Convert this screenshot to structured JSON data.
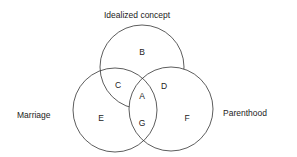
{
  "diagram": {
    "type": "venn",
    "sets": {
      "top": "Idealized concept",
      "left": "Marriage",
      "right": "Parenthood"
    },
    "regions": {
      "B": "B",
      "C": "C",
      "A": "A",
      "D": "D",
      "E": "E",
      "G": "G",
      "F": "F"
    },
    "colors": {
      "stroke": "#333333",
      "fill": "#ffffff",
      "text": "#222222"
    }
  }
}
